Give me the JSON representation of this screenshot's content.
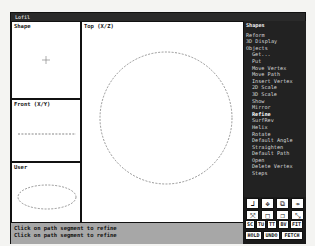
{
  "window": {
    "title": "Lofil"
  },
  "viewports": {
    "shape": {
      "label": "Shape"
    },
    "top": {
      "label": "Top (X/Z)"
    },
    "front": {
      "label": "Front (X/Y)"
    },
    "user": {
      "label": "User"
    }
  },
  "menu": {
    "header": "Shapes",
    "items": [
      {
        "label": "Reform",
        "sub": false
      },
      {
        "label": "3D Display",
        "sub": false
      },
      {
        "label": "Objects",
        "sub": false
      },
      {
        "label": "Get...",
        "sub": true
      },
      {
        "label": "Put",
        "sub": true
      },
      {
        "label": "Move Vertex",
        "sub": true
      },
      {
        "label": "Move Path",
        "sub": true
      },
      {
        "label": "Insert Vertex",
        "sub": true
      },
      {
        "label": "2D Scale",
        "sub": true
      },
      {
        "label": "3D Scale",
        "sub": true
      },
      {
        "label": "Show",
        "sub": true
      },
      {
        "label": "Mirror",
        "sub": true
      },
      {
        "label": "Refine",
        "sub": true,
        "highlighted": true
      },
      {
        "label": "SurfRev",
        "sub": true
      },
      {
        "label": "Helix",
        "sub": true
      },
      {
        "label": "Rotate",
        "sub": true
      },
      {
        "label": "Default Angle",
        "sub": true
      },
      {
        "label": "Straighten",
        "sub": true
      },
      {
        "label": "Default Path",
        "sub": true
      },
      {
        "label": "Open",
        "sub": true
      },
      {
        "label": "Delete Vertex",
        "sub": true
      },
      {
        "label": "Steps",
        "sub": true
      }
    ]
  },
  "toolbar": {
    "icons": [
      "axis-icon",
      "move-icon",
      "zoom-box-icon",
      "pan-arrow-icon",
      "zoom-in-icon",
      "region-icon",
      "box-icon",
      "zoom-out-icon"
    ],
    "tween": "TWEEN",
    "row1": [
      "SC",
      "TU",
      "TT",
      "BV",
      "FIT"
    ],
    "row2": [
      "HOLD",
      "UNDO",
      "FETCH"
    ]
  },
  "status": {
    "line1": "Click on path segment to refine",
    "line2": "Click on path segment to refine"
  }
}
